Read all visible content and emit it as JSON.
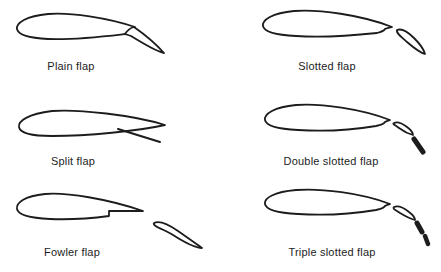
{
  "figures": [
    {
      "label": "Plain flap"
    },
    {
      "label": "Slotted flap"
    },
    {
      "label": "Split flap"
    },
    {
      "label": "Double slotted flap"
    },
    {
      "label": "Fowler flap"
    },
    {
      "label": "Triple slotted flap"
    }
  ],
  "colors": {
    "line": "#1c1c1c",
    "background": "#ffffff"
  }
}
